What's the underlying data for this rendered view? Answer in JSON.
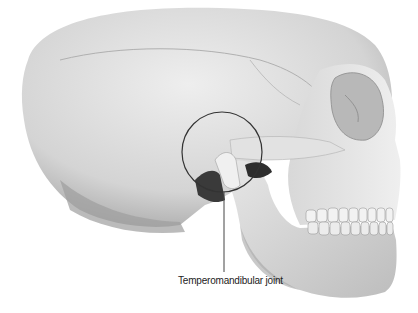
{
  "figure": {
    "highlight": "tmj-circle"
  },
  "labels": {
    "tmj": "Temperomandibular joint"
  },
  "colors": {
    "bone_light": "#e6e6e6",
    "bone_mid": "#cfcfcf",
    "bone_shadow": "#9a9a9a",
    "shadow_dark": "#3a3a3a",
    "outline": "#333333",
    "background": "#ffffff"
  }
}
